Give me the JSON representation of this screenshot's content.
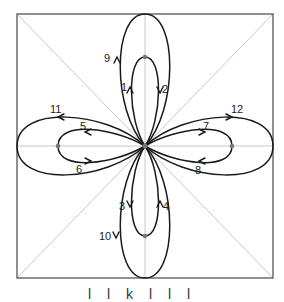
{
  "diagram": {
    "frame": {
      "x": 17,
      "y": 14,
      "w": 256,
      "h": 264
    },
    "center": {
      "x": 145,
      "y": 146
    },
    "colors": {
      "frame": "#555555",
      "guides": "#c8c8c8",
      "curves": "#1a1a1a",
      "dots": "#777777"
    },
    "dots": [
      {
        "name": "top-dot",
        "x": 145,
        "y": 57
      },
      {
        "name": "left-dot",
        "x": 58,
        "y": 146
      },
      {
        "name": "right-dot",
        "x": 232,
        "y": 146
      },
      {
        "name": "bottom-dot",
        "x": 145,
        "y": 236
      }
    ],
    "labels": [
      {
        "text": "1",
        "x": 121,
        "y": 91
      },
      {
        "text": "2",
        "x": 164,
        "y": 92
      },
      {
        "text": "3",
        "x": 119,
        "y": 210
      },
      {
        "text": "4",
        "x": 164,
        "y": 210
      },
      {
        "text": "5",
        "x": 80,
        "y": 130
      },
      {
        "text": "6",
        "x": 75,
        "y": 172
      },
      {
        "text": "7",
        "x": 203,
        "y": 130
      },
      {
        "text": "8",
        "x": 195,
        "y": 174
      },
      {
        "text": "9",
        "x": 103,
        "y": 62
      },
      {
        "text": "10",
        "x": 99,
        "y": 240
      },
      {
        "text": "11",
        "x": 51,
        "y": 113
      },
      {
        "text": "12",
        "x": 231,
        "y": 113
      }
    ]
  },
  "caption": "l l k l l l"
}
